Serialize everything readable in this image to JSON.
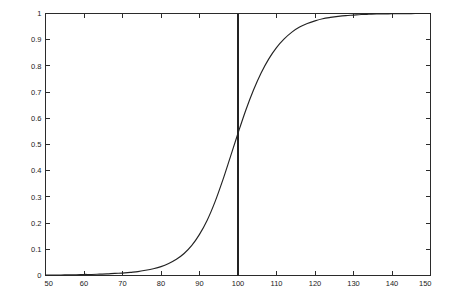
{
  "figure": {
    "background_color": "#ffffff",
    "axes_color": "#2b2b2b",
    "curve_color": "#232323",
    "width": 451,
    "height": 304
  },
  "chart_data": {
    "type": "line",
    "title": "",
    "subtitle": "",
    "xlabel": "",
    "ylabel": "",
    "xlim": [
      50,
      150
    ],
    "ylim": [
      0,
      1
    ],
    "grid": false,
    "legend": "none",
    "box": true,
    "tick_direction": "in",
    "xticks": [
      50,
      60,
      70,
      80,
      90,
      100,
      110,
      120,
      130,
      140,
      150
    ],
    "xtick_labels": [
      "50",
      "60",
      "70",
      "80",
      "90",
      "100",
      "110",
      "120",
      "130",
      "140",
      "150"
    ],
    "yticks": [
      0,
      0.1,
      0.2,
      0.3,
      0.4,
      0.5,
      0.6,
      0.7,
      0.8,
      0.9,
      1
    ],
    "ytick_labels": [
      "0",
      "0.1",
      "0.2",
      "0.3",
      "0.4",
      "0.5",
      "0.6",
      "0.7",
      "0.8",
      "0.9",
      "1"
    ],
    "series": [
      {
        "name": "sigmoid-cdf",
        "kind": "line",
        "x": [
          50,
          52,
          54,
          56,
          58,
          60,
          62,
          64,
          66,
          68,
          70,
          72,
          74,
          76,
          78,
          80,
          82,
          84,
          86,
          88,
          90,
          92,
          94,
          96,
          98,
          100,
          102,
          104,
          106,
          108,
          110,
          112,
          114,
          116,
          118,
          120,
          122,
          124,
          126,
          128,
          130,
          132,
          134,
          136,
          138,
          140,
          142,
          144,
          146,
          148,
          150
        ],
        "values": [
          0.002,
          0.002,
          0.002,
          0.003,
          0.003,
          0.004,
          0.004,
          0.005,
          0.006,
          0.008,
          0.009,
          0.012,
          0.015,
          0.02,
          0.026,
          0.034,
          0.046,
          0.062,
          0.084,
          0.115,
          0.157,
          0.211,
          0.28,
          0.362,
          0.452,
          0.543,
          0.63,
          0.707,
          0.773,
          0.827,
          0.87,
          0.903,
          0.929,
          0.948,
          0.962,
          0.972,
          0.98,
          0.985,
          0.989,
          0.992,
          0.994,
          0.996,
          0.997,
          0.998,
          0.998,
          0.999,
          0.999,
          0.999,
          1.0,
          1.0,
          1.0
        ]
      },
      {
        "name": "reference-vertical-line",
        "kind": "vline",
        "x_value": 100,
        "y_from": 0,
        "y_to": 1
      }
    ],
    "annotations": [
      {
        "name": "crossing-point",
        "x": 100,
        "y": 0.53,
        "label": ""
      }
    ]
  }
}
